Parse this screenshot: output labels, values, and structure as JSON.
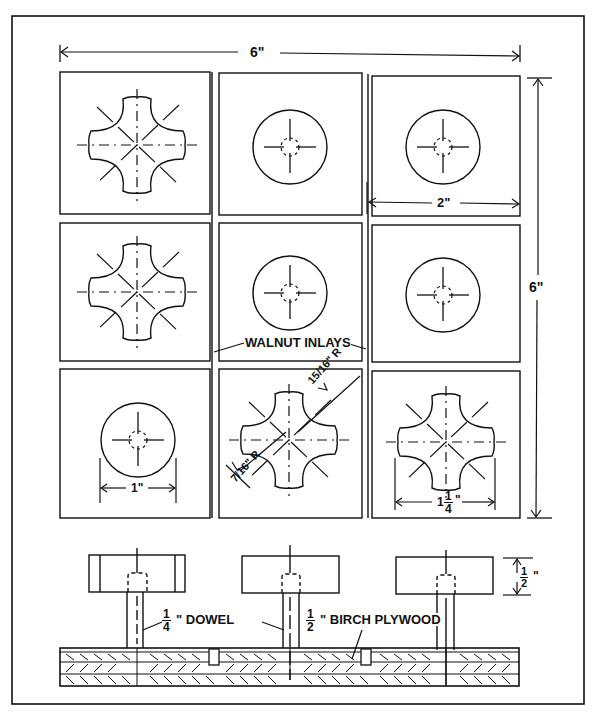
{
  "drawing": {
    "type": "woodworking plan - peg puzzle board",
    "colors": {
      "ink": "#111111",
      "paper": "#ffffff"
    },
    "dimensions": {
      "overall_width": "6\"",
      "overall_height": "6\"",
      "tile_width": "2\"",
      "round_piece_diameter": "1\"",
      "cross_piece_width_whole": "1",
      "cross_piece_width_frac_num": "1",
      "cross_piece_width_frac_den": "4",
      "cross_piece_width_unit": "\"",
      "corner_radius_num": "15",
      "corner_radius_den": "16",
      "corner_radius_prefix": "R",
      "end_radius_num": "7",
      "end_radius_den": "16",
      "end_radius_prefix": "R",
      "piece_thickness_num": "1",
      "piece_thickness_den": "2",
      "piece_thickness_unit": "\""
    },
    "labels": {
      "walnut_inlays": "WALNUT INLAYS",
      "dowel_num": "1",
      "dowel_den": "4",
      "dowel_text": "\" DOWEL",
      "plywood_num": "1",
      "plywood_den": "2",
      "plywood_text": "\" BIRCH PLYWOOD"
    },
    "grid": {
      "rows": 3,
      "cols": 3,
      "pieces": [
        [
          "cross",
          "round",
          "round"
        ],
        [
          "cross",
          "round",
          "round"
        ],
        [
          "round",
          "cross",
          "cross"
        ]
      ]
    },
    "section_view": {
      "pieces": [
        "round-with-bands",
        "round",
        "round"
      ]
    }
  }
}
